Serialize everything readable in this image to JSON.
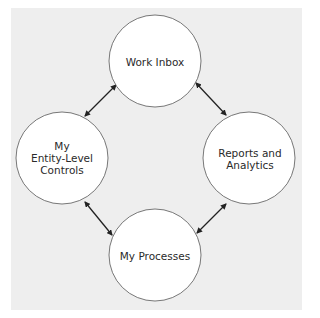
{
  "diagram": {
    "colors": {
      "background": "#eeeeee",
      "node_fill": "#ffffff",
      "node_stroke": "#555555",
      "arrow": "#222222"
    },
    "nodes": [
      {
        "id": "work-inbox",
        "label": "Work Inbox",
        "cx": 155,
        "cy": 61,
        "r": 46
      },
      {
        "id": "my-entity-level-controls",
        "label_lines": [
          "My",
          "Entity-Level",
          "Controls"
        ],
        "cx": 62,
        "cy": 158,
        "r": 46
      },
      {
        "id": "reports-and-analytics",
        "label_lines": [
          "Reports and",
          "Analytics"
        ],
        "cx": 249,
        "cy": 158,
        "r": 46
      },
      {
        "id": "my-processes",
        "label": "My Processes",
        "cx": 155,
        "cy": 255,
        "r": 46
      }
    ],
    "edges": [
      {
        "from": "work-inbox",
        "to": "my-entity-level-controls",
        "direction": "both"
      },
      {
        "from": "work-inbox",
        "to": "reports-and-analytics",
        "direction": "both"
      },
      {
        "from": "my-entity-level-controls",
        "to": "my-processes",
        "direction": "both"
      },
      {
        "from": "reports-and-analytics",
        "to": "my-processes",
        "direction": "both"
      }
    ]
  }
}
